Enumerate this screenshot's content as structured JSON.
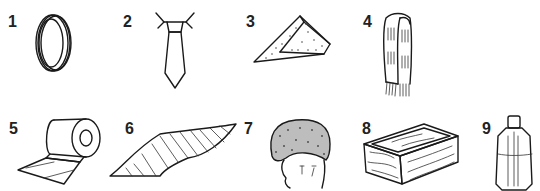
{
  "items": [
    {
      "number": "1",
      "icon": "ring-icon"
    },
    {
      "number": "2",
      "icon": "tie-icon"
    },
    {
      "number": "3",
      "icon": "handkerchief-icon"
    },
    {
      "number": "4",
      "icon": "scarf-icon"
    },
    {
      "number": "5",
      "icon": "bandage-roll-icon"
    },
    {
      "number": "6",
      "icon": "silk-scarf-icon"
    },
    {
      "number": "7",
      "icon": "fur-hat-icon"
    },
    {
      "number": "8",
      "icon": "wooden-box-icon"
    },
    {
      "number": "9",
      "icon": "bottle-icon"
    }
  ]
}
